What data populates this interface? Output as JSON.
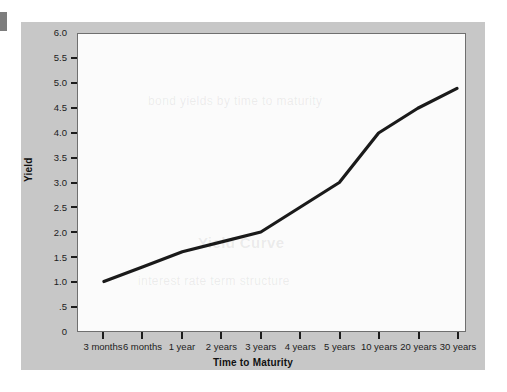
{
  "chart_data": {
    "type": "line",
    "title": "",
    "xlabel": "Time to Maturity",
    "ylabel": "Yield",
    "categories": [
      "3 months",
      "6 months",
      "1 year",
      "2 years",
      "3 years",
      "4 years",
      "5 years",
      "10 years",
      "20 years",
      "30 years"
    ],
    "values": [
      1.0,
      1.3,
      1.6,
      1.8,
      2.0,
      2.5,
      3.0,
      4.0,
      4.5,
      4.9
    ],
    "series": [
      {
        "name": "Yield",
        "values": [
          1.0,
          1.3,
          1.6,
          1.8,
          2.0,
          2.5,
          3.0,
          4.0,
          4.5,
          4.9
        ]
      }
    ],
    "ylim": [
      0,
      6.0
    ],
    "y_tick_values": [
      6.0,
      5.5,
      5.0,
      4.5,
      4.0,
      3.5,
      3.0,
      2.5,
      2.0,
      1.5,
      1.0,
      0.5,
      0
    ],
    "y_tick_labels": [
      "6.0",
      "5.5",
      "5.0",
      "4.5",
      "4.0",
      "3.5",
      "3.0",
      "2.5",
      "2.0",
      "1.5",
      "1.0",
      ".5",
      "0"
    ],
    "grid": false,
    "legend": "none",
    "line_color": "#1a1a1a",
    "plot_background": "#fbfbfb",
    "figure_background": "#c7c7c7"
  },
  "watermark": {
    "line1": "Yield Curve",
    "line2": "bond yields by time to maturity",
    "line3": "interest rate term structure"
  }
}
